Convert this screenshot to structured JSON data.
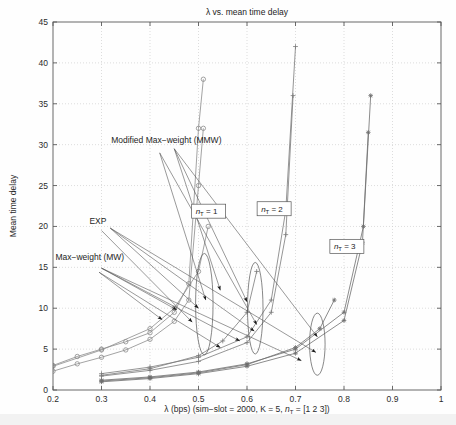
{
  "chart_data": {
    "type": "line",
    "title": "λ vs. mean time delay",
    "xlabel": "λ (bps) (sim−slot = 2000, K = 5, n_T = [1 2 3])",
    "ylabel": "Mean time delay",
    "xlim": [
      0.2,
      1.0
    ],
    "ylim": [
      0,
      45
    ],
    "xticks": [
      0.2,
      0.3,
      0.4,
      0.5,
      0.6,
      0.7,
      0.8,
      0.9,
      1
    ],
    "xticklabels": [
      "0.2",
      "0.3",
      "0.4",
      "0.5",
      "0.6",
      "0.7",
      "0.8",
      "0.9",
      "1"
    ],
    "yticks": [
      0,
      5,
      10,
      15,
      20,
      25,
      30,
      35,
      40,
      45
    ],
    "yticklabels": [
      "0",
      "5",
      "10",
      "15",
      "20",
      "25",
      "30",
      "35",
      "40",
      "45"
    ],
    "grid": true,
    "legend": "none",
    "series": [
      {
        "name": "EXP n_T = 1",
        "marker": "circle",
        "color": "#8c8c8c",
        "x": [
          0.2,
          0.25,
          0.3,
          0.35,
          0.4,
          0.45,
          0.48,
          0.5,
          0.51
        ],
        "values": [
          3.0,
          4.1,
          5.0,
          5.9,
          7.0,
          9.5,
          13.0,
          32.0,
          38.0
        ]
      },
      {
        "name": "MMW n_T = 1",
        "marker": "circle",
        "color": "#8c8c8c",
        "x": [
          0.2,
          0.25,
          0.3,
          0.35,
          0.4,
          0.45,
          0.48,
          0.5,
          0.51
        ],
        "values": [
          2.3,
          3.2,
          4.0,
          4.9,
          6.2,
          8.4,
          11.0,
          25.0,
          32.0
        ]
      },
      {
        "name": "MW n_T = 1",
        "marker": "circle",
        "color": "#8c8c8c",
        "x": [
          0.2,
          0.3,
          0.4,
          0.45,
          0.5,
          0.52
        ],
        "values": [
          2.9,
          4.9,
          7.5,
          10.0,
          14.5,
          20.0
        ]
      },
      {
        "name": "EXP n_T = 2",
        "marker": "plus",
        "color": "#7a7a7a",
        "x": [
          0.3,
          0.4,
          0.5,
          0.6,
          0.65,
          0.68,
          0.7
        ],
        "values": [
          2.0,
          2.8,
          4.0,
          6.5,
          11.0,
          22.0,
          42.0
        ]
      },
      {
        "name": "MMW n_T = 2",
        "marker": "plus",
        "color": "#7a7a7a",
        "x": [
          0.3,
          0.4,
          0.5,
          0.6,
          0.65,
          0.68,
          0.695
        ],
        "values": [
          1.7,
          2.4,
          3.5,
          5.8,
          9.5,
          19.0,
          36.0
        ]
      },
      {
        "name": "MW n_T = 2",
        "marker": "plus",
        "color": "#7a7a7a",
        "x": [
          0.3,
          0.4,
          0.5,
          0.55,
          0.6,
          0.62
        ],
        "values": [
          1.8,
          2.6,
          4.2,
          6.0,
          9.5,
          14.5
        ]
      },
      {
        "name": "EXP n_T = 3",
        "marker": "star",
        "color": "#6f6f6f",
        "x": [
          0.3,
          0.4,
          0.5,
          0.6,
          0.7,
          0.8,
          0.84,
          0.855
        ],
        "values": [
          1.2,
          1.6,
          2.2,
          3.2,
          5.0,
          9.5,
          20.0,
          36.0
        ]
      },
      {
        "name": "MMW n_T = 3",
        "marker": "star",
        "color": "#6f6f6f",
        "x": [
          0.3,
          0.4,
          0.5,
          0.6,
          0.7,
          0.8,
          0.838,
          0.85
        ],
        "values": [
          1.0,
          1.4,
          2.0,
          2.9,
          4.5,
          8.5,
          18.0,
          31.5
        ]
      },
      {
        "name": "MW n_T = 3",
        "marker": "star",
        "color": "#6f6f6f",
        "x": [
          0.3,
          0.4,
          0.5,
          0.6,
          0.7,
          0.75,
          0.78
        ],
        "values": [
          1.1,
          1.5,
          2.1,
          3.1,
          5.2,
          7.5,
          11.0
        ]
      }
    ],
    "annotations": [
      {
        "id": "mmw-label",
        "text": "Modified Max−weight (MMW)",
        "x": 0.32,
        "y": 30.2
      },
      {
        "id": "exp-label",
        "text": "EXP",
        "x": 0.275,
        "y": 20.3
      },
      {
        "id": "mw-label",
        "text": "Max−weight (MW)",
        "x": 0.205,
        "y": 15.9
      }
    ],
    "boxed_labels": [
      {
        "id": "nt1",
        "text": "n_T = 1",
        "x": 0.49,
        "y": 21.5
      },
      {
        "id": "nt2",
        "text": "n_T = 2",
        "x": 0.625,
        "y": 21.8
      },
      {
        "id": "nt3",
        "text": "n_T = 3",
        "x": 0.775,
        "y": 17.2
      }
    ],
    "ellipses": [
      {
        "id": "group-nt1",
        "cx": 0.512,
        "cy": 10.5,
        "rx": 0.018,
        "ry": 6.2,
        "angle": 0
      },
      {
        "id": "group-nt2",
        "cx": 0.617,
        "cy": 10.0,
        "rx": 0.016,
        "ry": 5.6,
        "angle": 0
      },
      {
        "id": "group-nt3",
        "cx": 0.745,
        "cy": 5.6,
        "rx": 0.016,
        "ry": 3.8,
        "angle": 0
      }
    ]
  }
}
